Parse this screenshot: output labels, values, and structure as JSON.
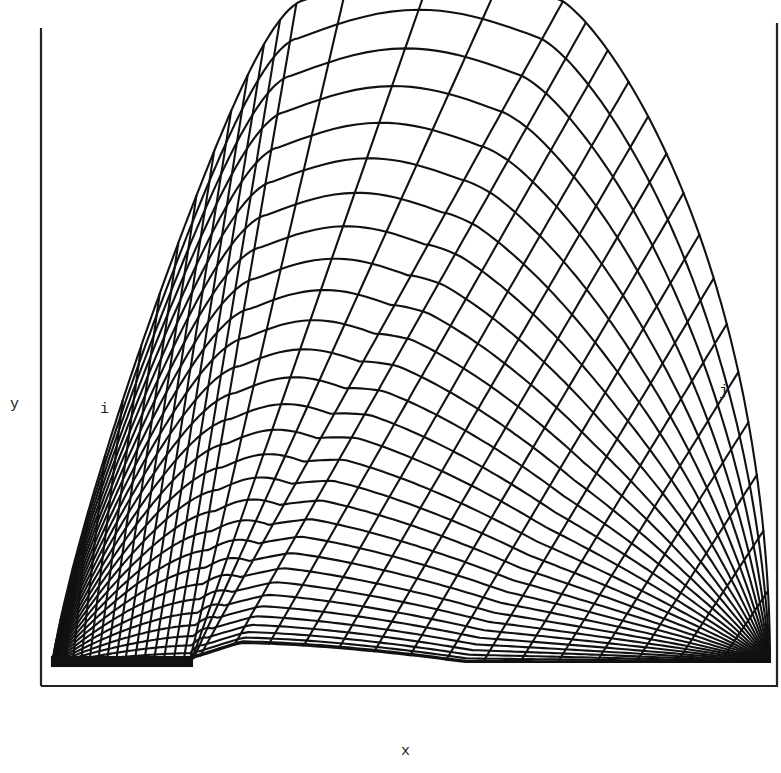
{
  "figure": {
    "type": "curvilinear computational grid",
    "labels": {
      "x_axis": "x",
      "y_axis": "y",
      "i_direction": "i",
      "j_direction": "j"
    },
    "colors": {
      "line": "#111111",
      "background": "#ffffff",
      "frame": "#222222"
    },
    "mesh": {
      "radial_lines": 34,
      "circumferential_lines": 30
    }
  }
}
